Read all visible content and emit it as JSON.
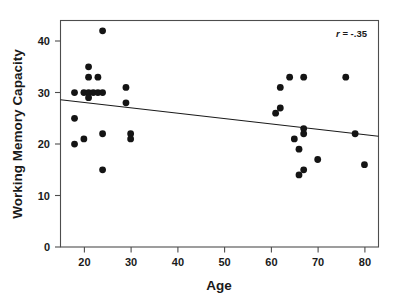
{
  "chart_data": {
    "type": "scatter",
    "title": "",
    "xlabel": "Age",
    "ylabel": "Working Memory Capacity",
    "xlim": [
      15,
      83
    ],
    "ylim": [
      0,
      44
    ],
    "xticks": [
      20,
      30,
      40,
      50,
      60,
      70,
      80
    ],
    "xtick_labels": [
      "20",
      "30",
      "40",
      "50",
      "60",
      "70",
      "80"
    ],
    "yticks": [
      0,
      10,
      20,
      30,
      40
    ],
    "ytick_labels": [
      "0",
      "10",
      "20",
      "30",
      "40"
    ],
    "grid": false,
    "legend": null,
    "annotations": [
      {
        "name": "correlation",
        "text_italic": "r",
        "text_rest": " = -.35",
        "full_text": "r = -.35",
        "value": -0.35,
        "x": 77,
        "y": 41.5
      }
    ],
    "series": [
      {
        "name": "participants",
        "marker": "filled-circle",
        "color": "#141414",
        "points": [
          {
            "x": 18,
            "y": 30
          },
          {
            "x": 18,
            "y": 25
          },
          {
            "x": 18,
            "y": 20
          },
          {
            "x": 20,
            "y": 30
          },
          {
            "x": 20,
            "y": 21
          },
          {
            "x": 21,
            "y": 35
          },
          {
            "x": 21,
            "y": 33
          },
          {
            "x": 21,
            "y": 30
          },
          {
            "x": 21,
            "y": 29
          },
          {
            "x": 22,
            "y": 30
          },
          {
            "x": 23,
            "y": 33
          },
          {
            "x": 23,
            "y": 30
          },
          {
            "x": 24,
            "y": 42
          },
          {
            "x": 24,
            "y": 30
          },
          {
            "x": 24,
            "y": 22
          },
          {
            "x": 24,
            "y": 15
          },
          {
            "x": 29,
            "y": 31
          },
          {
            "x": 29,
            "y": 28
          },
          {
            "x": 30,
            "y": 22
          },
          {
            "x": 30,
            "y": 21
          },
          {
            "x": 61,
            "y": 26
          },
          {
            "x": 62,
            "y": 31
          },
          {
            "x": 62,
            "y": 27
          },
          {
            "x": 64,
            "y": 33
          },
          {
            "x": 65,
            "y": 21
          },
          {
            "x": 66,
            "y": 19
          },
          {
            "x": 66,
            "y": 14
          },
          {
            "x": 67,
            "y": 33
          },
          {
            "x": 67,
            "y": 23
          },
          {
            "x": 67,
            "y": 22
          },
          {
            "x": 67,
            "y": 15
          },
          {
            "x": 70,
            "y": 17
          },
          {
            "x": 76,
            "y": 33
          },
          {
            "x": 78,
            "y": 22
          },
          {
            "x": 80,
            "y": 16
          }
        ]
      }
    ],
    "trend_line": {
      "name": "regression-line",
      "x1": 15,
      "y1": 28.6,
      "x2": 83,
      "y2": 21.5,
      "color": "#1a1a1a"
    }
  }
}
